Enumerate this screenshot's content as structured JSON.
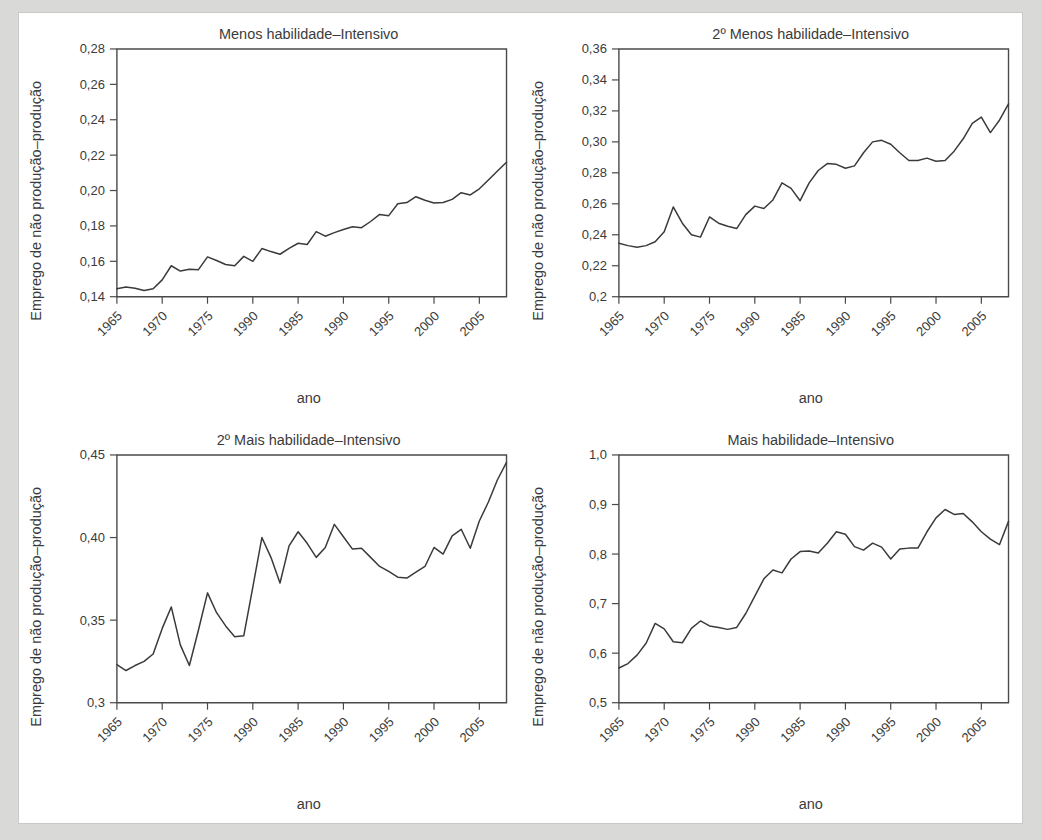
{
  "figure": {
    "background_color": "#d9d9d7",
    "sheet_color": "#ffffff",
    "line_color": "#3a3a3a",
    "axis_color": "#4a4a4a",
    "text_color": "#3b3b3b"
  },
  "shared": {
    "xlabel": "ano",
    "ylabel": "Emprego de não produção–produção",
    "xtick_labels": [
      "1965",
      "1970",
      "1975",
      "1990",
      "1985",
      "1990",
      "1995",
      "2000",
      "2005"
    ],
    "xtick_values": [
      1965,
      1970,
      1975,
      1980,
      1985,
      1990,
      1995,
      2000,
      2005
    ],
    "xlim": [
      1965,
      2008
    ]
  },
  "chart_data": [
    {
      "type": "line",
      "panel": "top-left",
      "title": "Menos habilidade–Intensivo",
      "xlabel": "ano",
      "ylabel": "Emprego de não produção–produção",
      "xlim": [
        1965,
        2008
      ],
      "ylim": [
        0.14,
        0.28
      ],
      "grid": false,
      "legend": "none",
      "ytick_labels": [
        "0,14",
        "0,16",
        "0,18",
        "0,20",
        "0,22",
        "0,24",
        "0,26",
        "0,28"
      ],
      "ytick_values": [
        0.14,
        0.16,
        0.18,
        0.2,
        0.22,
        0.24,
        0.26,
        0.28
      ],
      "xtick_labels": [
        "1965",
        "1970",
        "1975",
        "1990",
        "1985",
        "1990",
        "1995",
        "2000",
        "2005"
      ],
      "xtick_values": [
        1965,
        1970,
        1975,
        1980,
        1985,
        1990,
        1995,
        2000,
        2005
      ],
      "x": [
        1965,
        1966,
        1967,
        1968,
        1969,
        1970,
        1971,
        1972,
        1973,
        1974,
        1975,
        1976,
        1977,
        1978,
        1979,
        1980,
        1981,
        1982,
        1983,
        1984,
        1985,
        1986,
        1987,
        1988,
        1989,
        1990,
        1991,
        1992,
        1993,
        1994,
        1995,
        1996,
        1997,
        1998,
        1999,
        2000,
        2001,
        2002,
        2003,
        2004,
        2005,
        2006,
        2007,
        2008
      ],
      "values": [
        0.1445,
        0.1455,
        0.1448,
        0.1435,
        0.1445,
        0.1495,
        0.1575,
        0.1545,
        0.1555,
        0.1553,
        0.1625,
        0.1605,
        0.1582,
        0.1575,
        0.1628,
        0.16,
        0.1672,
        0.1655,
        0.164,
        0.1673,
        0.1702,
        0.1695,
        0.1768,
        0.1742,
        0.1762,
        0.178,
        0.1795,
        0.179,
        0.1825,
        0.1865,
        0.1858,
        0.1925,
        0.1932,
        0.1965,
        0.1945,
        0.193,
        0.1932,
        0.195,
        0.1988,
        0.1975,
        0.201,
        0.206,
        0.211,
        0.216
      ]
    },
    {
      "type": "line",
      "panel": "top-right",
      "title": "2º Menos habilidade–Intensivo",
      "xlabel": "ano",
      "ylabel": "Emprego de não produção–produção",
      "xlim": [
        1965,
        2008
      ],
      "ylim": [
        0.2,
        0.36
      ],
      "grid": false,
      "legend": "none",
      "ytick_labels": [
        "0,2",
        "0,22",
        "0,24",
        "0,26",
        "0,28",
        "0,30",
        "0,32",
        "0,34",
        "0,36"
      ],
      "ytick_values": [
        0.2,
        0.22,
        0.24,
        0.26,
        0.28,
        0.3,
        0.32,
        0.34,
        0.36
      ],
      "xtick_labels": [
        "1965",
        "1970",
        "1975",
        "1990",
        "1985",
        "1990",
        "1995",
        "2000",
        "2005"
      ],
      "xtick_values": [
        1965,
        1970,
        1975,
        1980,
        1985,
        1990,
        1995,
        2000,
        2005
      ],
      "x": [
        1965,
        1966,
        1967,
        1968,
        1969,
        1970,
        1971,
        1972,
        1973,
        1974,
        1975,
        1976,
        1977,
        1978,
        1979,
        1980,
        1981,
        1982,
        1983,
        1984,
        1985,
        1986,
        1987,
        1988,
        1989,
        1990,
        1991,
        1992,
        1993,
        1994,
        1995,
        1996,
        1997,
        1998,
        1999,
        2000,
        2001,
        2002,
        2003,
        2004,
        2005,
        2006,
        2007,
        2008
      ],
      "values": [
        0.2345,
        0.233,
        0.232,
        0.233,
        0.2355,
        0.242,
        0.258,
        0.2475,
        0.24,
        0.2385,
        0.2515,
        0.2475,
        0.2455,
        0.244,
        0.253,
        0.2585,
        0.257,
        0.2625,
        0.2735,
        0.27,
        0.262,
        0.2735,
        0.2815,
        0.286,
        0.2855,
        0.283,
        0.2845,
        0.293,
        0.3,
        0.301,
        0.2985,
        0.293,
        0.288,
        0.288,
        0.2895,
        0.2875,
        0.288,
        0.294,
        0.302,
        0.312,
        0.316,
        0.306,
        0.314,
        0.3245
      ]
    },
    {
      "type": "line",
      "panel": "bottom-left",
      "title": "2º Mais habilidade–Intensivo",
      "xlabel": "ano",
      "ylabel": "Emprego de não produção–produção",
      "xlim": [
        1965,
        2008
      ],
      "ylim": [
        0.3,
        0.45
      ],
      "grid": false,
      "legend": "none",
      "ytick_labels": [
        "0,3",
        "0,35",
        "0,40",
        "0,45"
      ],
      "ytick_values": [
        0.3,
        0.35,
        0.4,
        0.45
      ],
      "xtick_labels": [
        "1965",
        "1970",
        "1975",
        "1990",
        "1985",
        "1990",
        "1995",
        "2000",
        "2005"
      ],
      "xtick_values": [
        1965,
        1970,
        1975,
        1980,
        1985,
        1990,
        1995,
        2000,
        2005
      ],
      "x": [
        1965,
        1966,
        1967,
        1968,
        1969,
        1970,
        1971,
        1972,
        1973,
        1974,
        1975,
        1976,
        1977,
        1978,
        1979,
        1980,
        1981,
        1982,
        1983,
        1984,
        1985,
        1986,
        1987,
        1988,
        1989,
        1990,
        1991,
        1992,
        1993,
        1994,
        1995,
        1996,
        1997,
        1998,
        1999,
        2000,
        2001,
        2002,
        2003,
        2004,
        2005,
        2006,
        2007,
        2008
      ],
      "values": [
        0.323,
        0.3195,
        0.3225,
        0.325,
        0.3295,
        0.345,
        0.358,
        0.335,
        0.3225,
        0.344,
        0.3665,
        0.3545,
        0.3465,
        0.34,
        0.3405,
        0.37,
        0.4,
        0.388,
        0.3725,
        0.395,
        0.4035,
        0.3965,
        0.388,
        0.394,
        0.408,
        0.4005,
        0.393,
        0.3935,
        0.388,
        0.3825,
        0.3795,
        0.376,
        0.3755,
        0.379,
        0.3825,
        0.394,
        0.39,
        0.401,
        0.405,
        0.3935,
        0.41,
        0.4215,
        0.435,
        0.4455
      ]
    },
    {
      "type": "line",
      "panel": "bottom-right",
      "title": "Mais habilidade–Intensivo",
      "xlabel": "ano",
      "ylabel": "Emprego de não produção–produção",
      "xlim": [
        1965,
        2008
      ],
      "ylim": [
        0.5,
        1.0
      ],
      "grid": false,
      "legend": "none",
      "ytick_labels": [
        "0,5",
        "0,6",
        "0,7",
        "0,8",
        "0,9",
        "1,0"
      ],
      "ytick_values": [
        0.5,
        0.6,
        0.7,
        0.8,
        0.9,
        1.0
      ],
      "xtick_labels": [
        "1965",
        "1970",
        "1975",
        "1990",
        "1985",
        "1990",
        "1995",
        "2000",
        "2005"
      ],
      "xtick_values": [
        1965,
        1970,
        1975,
        1980,
        1985,
        1990,
        1995,
        2000,
        2005
      ],
      "x": [
        1965,
        1966,
        1967,
        1968,
        1969,
        1970,
        1971,
        1972,
        1973,
        1974,
        1975,
        1976,
        1977,
        1978,
        1979,
        1980,
        1981,
        1982,
        1983,
        1984,
        1985,
        1986,
        1987,
        1988,
        1989,
        1990,
        1991,
        1992,
        1993,
        1994,
        1995,
        1996,
        1997,
        1998,
        1999,
        2000,
        2001,
        2002,
        2003,
        2004,
        2005,
        2006,
        2007,
        2008
      ],
      "values": [
        0.57,
        0.579,
        0.596,
        0.62,
        0.66,
        0.649,
        0.623,
        0.621,
        0.65,
        0.665,
        0.655,
        0.652,
        0.648,
        0.652,
        0.68,
        0.715,
        0.75,
        0.768,
        0.762,
        0.79,
        0.805,
        0.806,
        0.802,
        0.822,
        0.845,
        0.84,
        0.815,
        0.808,
        0.822,
        0.814,
        0.79,
        0.81,
        0.812,
        0.812,
        0.845,
        0.873,
        0.89,
        0.88,
        0.882,
        0.865,
        0.845,
        0.83,
        0.819,
        0.866
      ]
    }
  ]
}
